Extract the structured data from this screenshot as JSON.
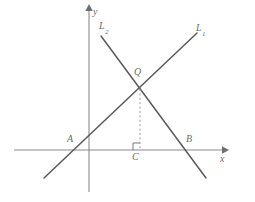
{
  "figure": {
    "kind": "coordinate-geometry-diagram",
    "background_color": "#ffffff",
    "line_color": "#5a5a5a",
    "axis_color": "#8a8a8a",
    "label_color": "#6b6b6b",
    "dash_color": "#9a9a9a"
  },
  "axes": {
    "x_axis_label": "x",
    "y_axis_label": "y",
    "x_axis": {
      "start_x": 14,
      "end_x": 226,
      "y": 150,
      "arrow": "right"
    },
    "y_axis": {
      "x": 89,
      "top_y": 7,
      "bottom_y": 192,
      "arrow": "up"
    }
  },
  "lines": [
    {
      "name": "L1",
      "label": "L",
      "subscript": "1",
      "direction": "rising",
      "from": {
        "x": 44,
        "y": 178
      },
      "to": {
        "x": 197,
        "y": 33
      }
    },
    {
      "name": "L2",
      "label": "L",
      "subscript": "2",
      "direction": "falling",
      "from": {
        "x": 101,
        "y": 36
      },
      "to": {
        "x": 206,
        "y": 178
      }
    }
  ],
  "points": [
    {
      "name": "A",
      "label": "A",
      "x": 75,
      "y": 150,
      "description": "x-intercept of L1"
    },
    {
      "name": "B",
      "label": "B",
      "x": 186,
      "y": 150,
      "description": "x-intercept of L2"
    },
    {
      "name": "C",
      "label": "C",
      "x": 140,
      "y": 150,
      "description": "foot of perpendicular from Q on x-axis"
    },
    {
      "name": "Q",
      "label": "Q",
      "x": 140,
      "y": 89,
      "description": "intersection of L1 and L2"
    }
  ],
  "segments": [
    {
      "name": "QC",
      "style": "dashed",
      "from": {
        "x": 140,
        "y": 89
      },
      "to": {
        "x": 140,
        "y": 150
      }
    }
  ],
  "marks": [
    {
      "name": "right-angle-at-C",
      "type": "right-angle",
      "vertex": {
        "x": 140,
        "y": 150
      },
      "size": 7
    }
  ]
}
